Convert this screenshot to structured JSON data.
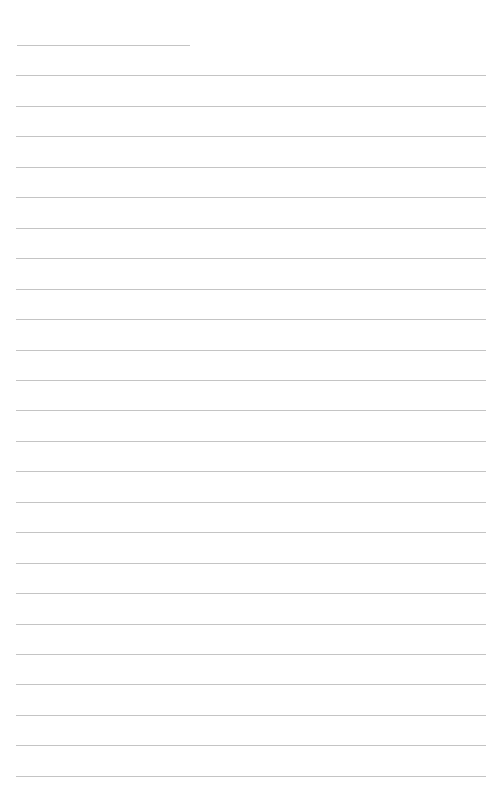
{
  "page": {
    "type": "lined-writing-page",
    "background": "#ffffff",
    "line_color": "#c4c4c4",
    "line_count": 25,
    "first_line": {
      "x1": 17,
      "x2": 190,
      "y": 45
    },
    "full_line": {
      "x1": 16,
      "x2": 486
    },
    "line_spacing": 30.45
  }
}
